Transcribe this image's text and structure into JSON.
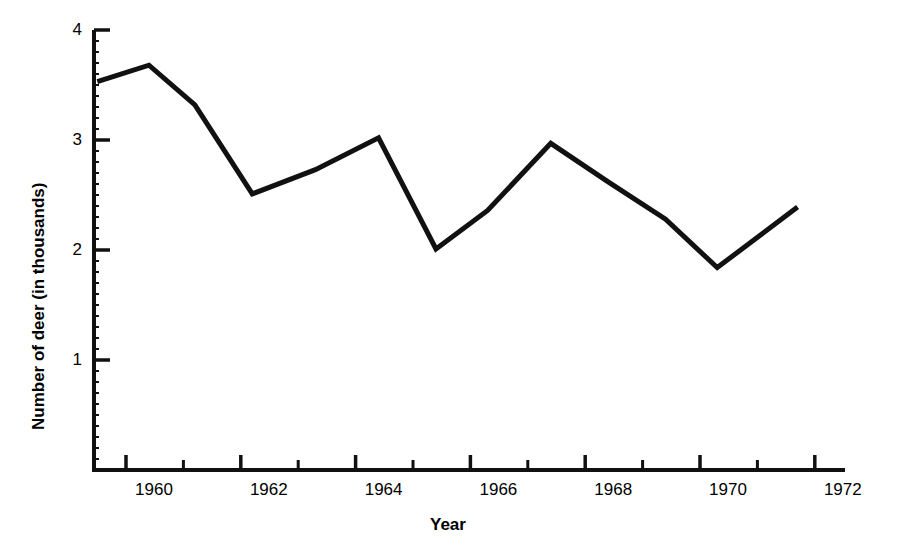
{
  "chart_data": {
    "type": "line",
    "title": "",
    "xlabel": "Year",
    "ylabel": "Number of deer (in thousands)",
    "xlim": [
      1959.4,
      1972.3
    ],
    "ylim": [
      0,
      4
    ],
    "grid": false,
    "legend": null,
    "x_tick_labels": [
      "1960",
      "1962",
      "1964",
      "1966",
      "1968",
      "1970",
      "1972"
    ],
    "x_tick_values": [
      1960,
      1962,
      1964,
      1966,
      1968,
      1970,
      1972
    ],
    "x_minor_tick_values": [
      1961,
      1963,
      1965,
      1967,
      1969,
      1971
    ],
    "y_tick_labels": [
      "1",
      "2",
      "3",
      "4"
    ],
    "y_tick_values": [
      1,
      2,
      3,
      4
    ],
    "x": [
      1959.5,
      1960.4,
      1961.2,
      1962.2,
      1963.3,
      1964.4,
      1965.4,
      1966.3,
      1967.4,
      1968.4,
      1969.4,
      1970.3,
      1971.7
    ],
    "values": [
      3.53,
      3.68,
      3.32,
      2.51,
      2.73,
      3.02,
      2.01,
      2.36,
      2.97,
      2.62,
      2.28,
      1.84,
      2.39
    ],
    "series": [
      {
        "name": "Number of deer",
        "color": "#111111",
        "values": [
          3.53,
          3.68,
          3.32,
          2.51,
          2.73,
          3.02,
          2.01,
          2.36,
          2.97,
          2.62,
          2.28,
          1.84,
          2.39
        ]
      }
    ]
  },
  "axes": {
    "y_label": "Number of deer (in thousands)",
    "x_label": "Year",
    "y_ticks": [
      {
        "label": "4",
        "value": 4
      },
      {
        "label": "3",
        "value": 3
      },
      {
        "label": "2",
        "value": 2
      },
      {
        "label": "1",
        "value": 1
      }
    ],
    "x_ticks": [
      {
        "label": "1960",
        "value": 1960
      },
      {
        "label": "1962",
        "value": 1962
      },
      {
        "label": "1964",
        "value": 1964
      },
      {
        "label": "1966",
        "value": 1966
      },
      {
        "label": "1968",
        "value": 1968
      },
      {
        "label": "1970",
        "value": 1970
      },
      {
        "label": "1972",
        "value": 1972
      }
    ]
  },
  "style": {
    "background": "#ffffff",
    "ink": "#111111",
    "line_color": "#111111"
  }
}
